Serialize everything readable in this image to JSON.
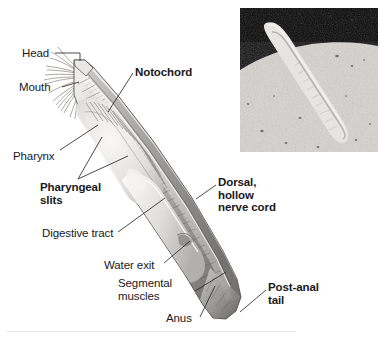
{
  "figure": {
    "background_color": "#ffffff",
    "width": 381,
    "height": 338
  },
  "labels": [
    {
      "id": "head",
      "text": "Head",
      "bold": false,
      "x": 22,
      "y": 47,
      "align": "left"
    },
    {
      "id": "mouth",
      "text": "Mouth",
      "bold": false,
      "x": 19,
      "y": 81,
      "align": "left"
    },
    {
      "id": "notochord",
      "text": "Notochord",
      "bold": true,
      "x": 135,
      "y": 66,
      "align": "left"
    },
    {
      "id": "pharynx",
      "text": "Pharynx",
      "bold": false,
      "x": 13,
      "y": 150,
      "align": "left"
    },
    {
      "id": "pharyngeal-slits",
      "text": "Pharyngeal\nslits",
      "bold": true,
      "x": 40,
      "y": 181,
      "align": "left"
    },
    {
      "id": "digestive-tract",
      "text": "Digestive tract",
      "bold": false,
      "x": 42,
      "y": 227,
      "align": "left"
    },
    {
      "id": "dorsal-nerve-cord",
      "text": "Dorsal,\nhollow\nnerve cord",
      "bold": true,
      "x": 218,
      "y": 176,
      "align": "left"
    },
    {
      "id": "water-exit",
      "text": "Water exit",
      "bold": false,
      "x": 104,
      "y": 259,
      "align": "left"
    },
    {
      "id": "segmental-muscles",
      "text": "Segmental\nmuscles",
      "bold": false,
      "x": 118,
      "y": 277,
      "align": "left"
    },
    {
      "id": "anus",
      "text": "Anus",
      "bold": false,
      "x": 166,
      "y": 312,
      "align": "left"
    },
    {
      "id": "post-anal-tail",
      "text": "Post-anal\ntail",
      "bold": true,
      "x": 268,
      "y": 281,
      "align": "left"
    }
  ],
  "photo_inset": {
    "caption": "Photograph of a lancelet buried in sand",
    "x": 240,
    "y": 8,
    "width": 138,
    "height": 144,
    "sand_color": "#d8d5d0",
    "sky_color": "#080808",
    "animal_color": "#e8e6e2"
  },
  "illustration": {
    "description": "Cutaway side view of a lancelet (Branchiostoma) oriented head-up to the left, tail down to the right",
    "body_color": "#b8b6b4",
    "body_highlight": "#f0efee",
    "body_shadow": "#6e6c6b",
    "notochord_color": "#cfcdcb",
    "outline_color": "#4a4947"
  },
  "leader_lines": {
    "color": "#2b2b2d",
    "count": 11
  }
}
